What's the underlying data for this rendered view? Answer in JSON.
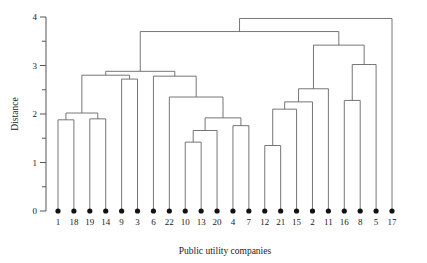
{
  "chart_data": {
    "type": "dendrogram",
    "title": "",
    "xlabel": "Public utility companies",
    "ylabel": "Distance",
    "ylim": [
      0,
      4
    ],
    "y_major_ticks": [
      0,
      1,
      2,
      3,
      4
    ],
    "y_major_tick_labels": [
      "0",
      "1",
      "2",
      "3",
      "4"
    ],
    "y_minor_ticks": [
      0.5,
      1.5,
      2.5,
      3.5
    ],
    "grid": false,
    "legend": null,
    "leaf_order": [
      "1",
      "18",
      "19",
      "14",
      "9",
      "3",
      "6",
      "22",
      "10",
      "13",
      "20",
      "4",
      "7",
      "12",
      "21",
      "15",
      "2",
      "11",
      "16",
      "8",
      "5",
      "17"
    ],
    "leaf_count": 22,
    "merges": [
      {
        "id": "m1",
        "left": "1",
        "right": "18",
        "height": 1.88
      },
      {
        "id": "m2",
        "left": "19",
        "right": "14",
        "height": 1.9
      },
      {
        "id": "m3",
        "left": "m1",
        "right": "m2",
        "height": 2.02
      },
      {
        "id": "m4",
        "left": "9",
        "right": "3",
        "height": 2.72
      },
      {
        "id": "m5",
        "left": "m3",
        "right": "m4",
        "height": 2.8
      },
      {
        "id": "m6",
        "left": "10",
        "right": "13",
        "height": 1.42
      },
      {
        "id": "m7",
        "left": "m6",
        "right": "20",
        "height": 1.66
      },
      {
        "id": "m8",
        "left": "4",
        "right": "7",
        "height": 1.76
      },
      {
        "id": "m9",
        "left": "m7",
        "right": "m8",
        "height": 1.92
      },
      {
        "id": "m10",
        "left": "22",
        "right": "m9",
        "height": 2.35
      },
      {
        "id": "m11",
        "left": "6",
        "right": "m10",
        "height": 2.78
      },
      {
        "id": "m12",
        "left": "m5",
        "right": "m11",
        "height": 2.88
      },
      {
        "id": "m13",
        "left": "12",
        "right": "21",
        "height": 1.35
      },
      {
        "id": "m14",
        "left": "m13",
        "right": "15",
        "height": 2.1
      },
      {
        "id": "m15",
        "left": "2",
        "right": "m14",
        "height": 2.25
      },
      {
        "id": "m16",
        "left": "11",
        "right": "m15",
        "height": 2.52
      },
      {
        "id": "m17",
        "left": "16",
        "right": "8",
        "height": 2.28
      },
      {
        "id": "m18",
        "left": "m17",
        "right": "5",
        "height": 3.02
      },
      {
        "id": "m19",
        "left": "m16",
        "right": "m18",
        "height": 3.42
      },
      {
        "id": "m20",
        "left": "m12",
        "right": "m19",
        "height": 3.7
      },
      {
        "id": "m21",
        "left": "m20",
        "right": "17",
        "height": 3.97
      }
    ]
  }
}
